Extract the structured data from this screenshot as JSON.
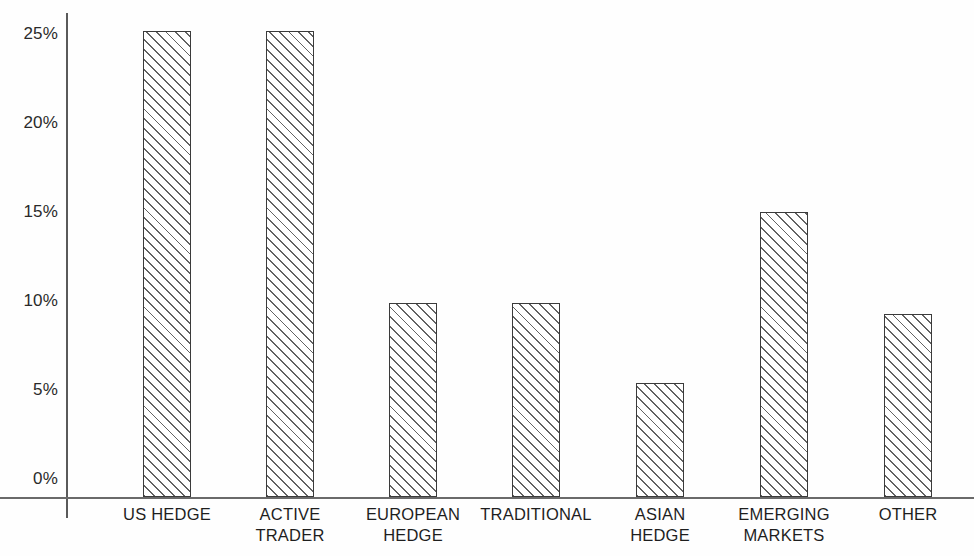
{
  "chart_data": {
    "type": "bar",
    "title": "",
    "subtitle": "",
    "xlabel": "",
    "ylabel": "",
    "categories": [
      "US HEDGE",
      "ACTIVE\nTRADER",
      "EUROPEAN\nHEDGE",
      "TRADITIONAL",
      "ASIAN\nHEDGE",
      "EMERGING\nMARKETS",
      "OTHER"
    ],
    "values": [
      25.0,
      25.0,
      10.4,
      10.4,
      6.1,
      15.3,
      9.8
    ],
    "value_labels": [
      "25%",
      "25%",
      "10.4%",
      "10.4%",
      "6.1%",
      "15.3%",
      "9.8%"
    ],
    "ylim": [
      0,
      26.7
    ],
    "yticks": [
      0,
      5,
      10,
      15,
      20,
      25
    ],
    "ytick_labels": [
      "0%",
      "5%",
      "10%",
      "15%",
      "20%",
      "25%"
    ],
    "grid": false,
    "legend": false,
    "legend_position": "none",
    "units": "percent",
    "series": [
      {
        "name": "share",
        "values": [
          25.0,
          25.0,
          10.4,
          10.4,
          6.1,
          15.3,
          9.8
        ]
      }
    ]
  },
  "style": {
    "background": "#fefefe",
    "bar_fill": "#ffffff",
    "bar_hatch_color": "#5a5a5a",
    "bar_edge": "#3b3b3b",
    "axis_color": "#5a5a5a",
    "text_color": "#1e1e1e"
  },
  "geometry": {
    "baseline_y": 497,
    "top_y": 31,
    "px_per_percent": 18.64,
    "bar_width": 48,
    "bar_centers": [
      167,
      290,
      413,
      536,
      660,
      784,
      908
    ]
  }
}
